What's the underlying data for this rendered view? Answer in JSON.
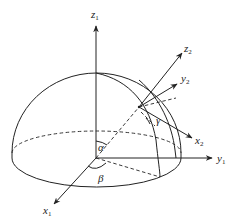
{
  "figure": {
    "axes_fixed": {
      "z": {
        "name": "z",
        "sub": "1"
      },
      "y": {
        "name": "y",
        "sub": "1"
      },
      "x": {
        "name": "x",
        "sub": "1"
      }
    },
    "axes_moving": {
      "z": {
        "name": "z",
        "sub": "2"
      },
      "y": {
        "name": "y",
        "sub": "2"
      },
      "x": {
        "name": "x",
        "sub": "2"
      }
    },
    "angles": {
      "alpha": "α",
      "beta": "β",
      "gamma": "γ"
    },
    "colors": {
      "line": "#222222",
      "background": "#ffffff"
    }
  }
}
